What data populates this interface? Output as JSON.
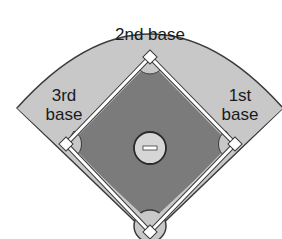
{
  "diagram": {
    "labels": {
      "second_base": "2nd base",
      "third_base_line1": "3rd",
      "third_base_line2": "base",
      "first_base_line1": "1st",
      "first_base_line2": "base"
    },
    "colors": {
      "outfield": "#c9c9c9",
      "infield_dirt": "#7a7a7a",
      "base_path": "#ffffff",
      "mound": "#d9d9d9",
      "outline": "#3a3a3a",
      "background": "#ffffff"
    },
    "elements": [
      "outfield",
      "infield",
      "pitcher-mound",
      "pitcher-rubber",
      "home-plate",
      "first-base",
      "second-base",
      "third-base"
    ]
  }
}
